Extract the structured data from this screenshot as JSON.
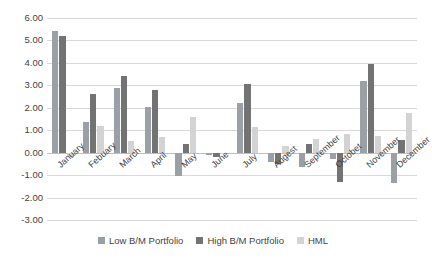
{
  "chart_data": {
    "type": "bar",
    "title": "",
    "subtitle": "",
    "xlabel": "",
    "ylabel": "",
    "ylim": [
      -3.0,
      6.0
    ],
    "ytick_step": 1.0,
    "ytick_labels": [
      "6.00",
      "5.00",
      "4.00",
      "3.00",
      "2.00",
      "1.00",
      "0.00",
      "-1.00",
      "-2.00",
      "-3.00"
    ],
    "ytick_values": [
      6.0,
      5.0,
      4.0,
      3.0,
      2.0,
      1.0,
      0.0,
      -1.0,
      -2.0,
      -3.0
    ],
    "grid": true,
    "legend_position": "bottom",
    "categories": [
      "January",
      "Febuary",
      "March",
      "April",
      "May",
      "June",
      "July",
      "Augest",
      "September",
      "Octobet",
      "November",
      "December"
    ],
    "series": [
      {
        "name": "Low B/M Portfolio",
        "color": "#9aa0a6",
        "values": [
          5.4,
          1.38,
          2.88,
          2.03,
          -1.02,
          -0.12,
          2.2,
          -0.4,
          -0.62,
          -0.3,
          3.2,
          -1.35
        ]
      },
      {
        "name": "High B/M Portfolio",
        "color": "#737373",
        "values": [
          5.18,
          2.6,
          3.42,
          2.78,
          0.4,
          -0.18,
          3.05,
          -0.5,
          0.4,
          -1.3,
          3.95,
          0.55
        ]
      },
      {
        "name": "HML",
        "color": "#d3d3d3",
        "values": [
          -0.2,
          1.18,
          0.53,
          0.68,
          1.6,
          -0.05,
          1.15,
          0.3,
          0.6,
          0.85,
          0.75,
          1.75
        ]
      }
    ]
  },
  "legend": {
    "items": [
      {
        "label": "Low B/M Portfolio",
        "color": "#9aa0a6"
      },
      {
        "label": "High B/M Portfolio",
        "color": "#737373"
      },
      {
        "label": "HML",
        "color": "#d3d3d3"
      }
    ]
  }
}
